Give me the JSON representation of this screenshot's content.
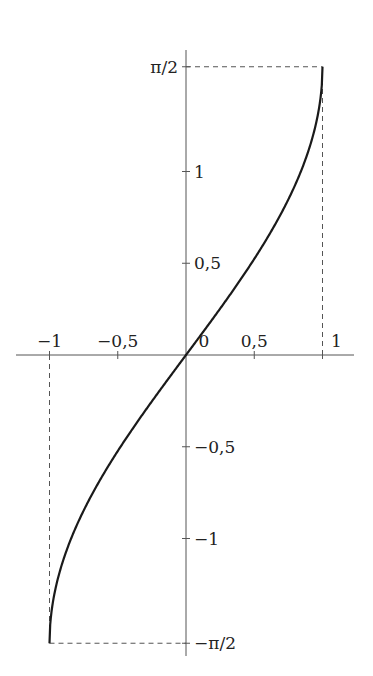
{
  "chart_data": {
    "type": "line",
    "title": "",
    "function": "arcsin(x)",
    "xlabel": "",
    "ylabel": "",
    "xlim": [
      -1.25,
      1.25
    ],
    "ylim": [
      -1.65,
      1.65
    ],
    "grid": false,
    "legend": null,
    "x_ticks": [
      {
        "value": -1,
        "label": "−1"
      },
      {
        "value": -0.5,
        "label": "−0,5"
      },
      {
        "value": 0,
        "label": "0"
      },
      {
        "value": 0.5,
        "label": "0,5"
      },
      {
        "value": 1,
        "label": "1"
      }
    ],
    "y_ticks": [
      {
        "value": 1.5708,
        "label": "π/2"
      },
      {
        "value": 1,
        "label": "1"
      },
      {
        "value": 0.5,
        "label": "0,5"
      },
      {
        "value": -0.5,
        "label": "−0,5"
      },
      {
        "value": -1,
        "label": "−1"
      },
      {
        "value": -1.5708,
        "label": "−π/2"
      }
    ],
    "series": [
      {
        "name": "arcsin",
        "x": [
          -1,
          -0.99,
          -0.95,
          -0.9,
          -0.8,
          -0.7,
          -0.6,
          -0.5,
          -0.4,
          -0.3,
          -0.2,
          -0.1,
          0,
          0.1,
          0.2,
          0.3,
          0.4,
          0.5,
          0.6,
          0.7,
          0.8,
          0.9,
          0.95,
          0.99,
          1
        ],
        "y": [
          -1.5708,
          -1.4293,
          -1.2532,
          -1.1198,
          -0.9273,
          -0.7754,
          -0.6435,
          -0.5236,
          -0.4115,
          -0.3047,
          -0.2014,
          -0.1002,
          0,
          0.1002,
          0.2014,
          0.3047,
          0.4115,
          0.5236,
          0.6435,
          0.7754,
          0.9273,
          1.1198,
          1.2532,
          1.4293,
          1.5708
        ]
      }
    ],
    "guides": [
      {
        "type": "dashed",
        "from": [
          -1,
          0
        ],
        "to": [
          -1,
          -1.5708
        ]
      },
      {
        "type": "dashed",
        "from": [
          -1,
          -1.5708
        ],
        "to": [
          0,
          -1.5708
        ]
      },
      {
        "type": "dashed",
        "from": [
          1,
          0
        ],
        "to": [
          1,
          1.5708
        ]
      },
      {
        "type": "dashed",
        "from": [
          0,
          1.5708
        ],
        "to": [
          1,
          1.5708
        ]
      }
    ]
  },
  "layout": {
    "origin_px": [
      186,
      355
    ],
    "x_unit_px": 136.5,
    "y_unit_px": 183.5,
    "x_axis_px": [
      16,
      354
    ],
    "y_axis_px": [
      50,
      656
    ]
  }
}
